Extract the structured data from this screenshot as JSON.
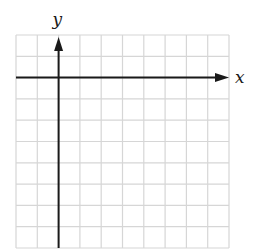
{
  "diagram": {
    "type": "coordinate-grid",
    "grid": {
      "columns": 10,
      "rows": 10,
      "left": 16,
      "top": 35,
      "cell_size": 21.3,
      "line_color": "#d6d6d6"
    },
    "axes": {
      "color": "#1a1a1a",
      "x_axis_row": 2,
      "y_axis_column": 2,
      "x_label": "x",
      "y_label": "y"
    }
  }
}
